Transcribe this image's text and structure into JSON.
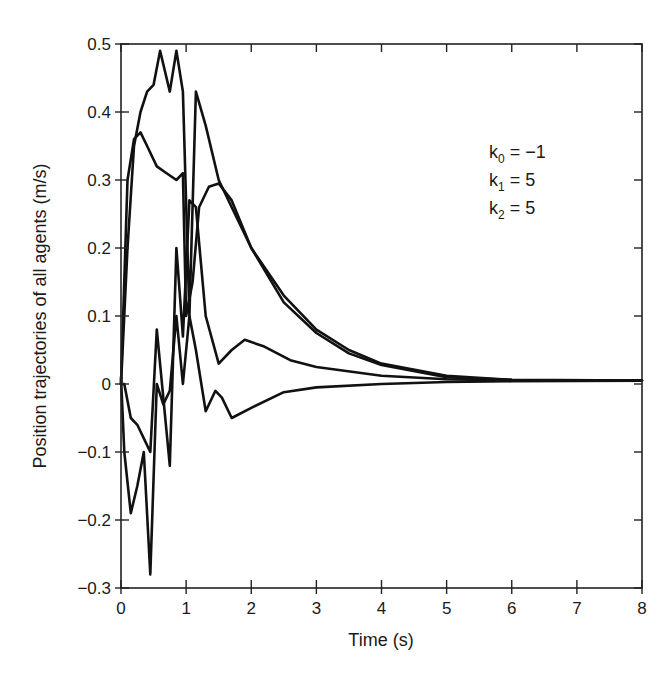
{
  "chart_data": {
    "type": "line",
    "title": "",
    "xlabel": "Time (s)",
    "ylabel": "Position trajectories of all agents (m/s)",
    "xlim": [
      0,
      8
    ],
    "ylim": [
      -0.3,
      0.5
    ],
    "xticks": [
      0,
      1,
      2,
      3,
      4,
      5,
      6,
      7,
      8
    ],
    "xtick_labels": [
      "0",
      "1",
      "2",
      "3",
      "4",
      "5",
      "6",
      "7",
      "8"
    ],
    "yticks": [
      -0.3,
      -0.2,
      -0.1,
      0,
      0.1,
      0.2,
      0.3,
      0.4,
      0.5
    ],
    "ytick_labels": [
      "−0.3",
      "−0.2",
      "−0.1",
      "0",
      "0.1",
      "0.2",
      "0.3",
      "0.4",
      "0.5"
    ],
    "grid": false,
    "legend": null,
    "annotations": [
      {
        "base": "k",
        "sub": "0",
        "rest": " = −1"
      },
      {
        "base": "k",
        "sub": "1",
        "rest": " = 5"
      },
      {
        "base": "k",
        "sub": "2",
        "rest": " = 5"
      }
    ],
    "series": [
      {
        "name": "agent 1",
        "x": [
          0,
          0.1,
          0.2,
          0.3,
          0.4,
          0.5,
          0.6,
          0.75,
          0.85,
          0.95,
          1.05,
          1.15,
          1.3,
          1.5,
          1.7,
          2.0,
          2.5,
          3.0,
          3.5,
          4.0,
          5.0,
          6.0,
          8.0
        ],
        "y": [
          0.0,
          0.2,
          0.35,
          0.4,
          0.43,
          0.44,
          0.49,
          0.43,
          0.49,
          0.43,
          0.1,
          0.43,
          0.38,
          0.3,
          0.26,
          0.2,
          0.13,
          0.08,
          0.05,
          0.03,
          0.012,
          0.006,
          0.005
        ]
      },
      {
        "name": "agent 2",
        "x": [
          0,
          0.1,
          0.2,
          0.3,
          0.4,
          0.55,
          0.7,
          0.85,
          0.95,
          1.0,
          1.1,
          1.2,
          1.35,
          1.5,
          1.7,
          2.0,
          2.5,
          3.0,
          3.5,
          4.0,
          5.0,
          6.0,
          8.0
        ],
        "y": [
          0.0,
          0.3,
          0.36,
          0.37,
          0.35,
          0.32,
          0.31,
          0.3,
          0.31,
          0.1,
          0.15,
          0.26,
          0.29,
          0.295,
          0.27,
          0.2,
          0.12,
          0.075,
          0.045,
          0.028,
          0.01,
          0.006,
          0.005
        ]
      },
      {
        "name": "agent 3",
        "x": [
          0,
          0.05,
          0.15,
          0.25,
          0.35,
          0.45,
          0.55,
          0.65,
          0.75,
          0.85,
          0.95,
          1.05,
          1.15,
          1.3,
          1.5,
          1.7,
          1.9,
          2.2,
          2.6,
          3.0,
          4.0,
          5.0,
          6.0,
          8.0
        ],
        "y": [
          0.0,
          0.0,
          -0.05,
          -0.06,
          -0.08,
          -0.1,
          0.08,
          -0.02,
          -0.12,
          0.2,
          0.07,
          0.27,
          0.26,
          0.1,
          0.03,
          0.05,
          0.065,
          0.055,
          0.035,
          0.025,
          0.012,
          0.007,
          0.005,
          0.005
        ]
      },
      {
        "name": "agent 4",
        "x": [
          0,
          0.05,
          0.15,
          0.25,
          0.35,
          0.45,
          0.55,
          0.65,
          0.75,
          0.85,
          0.95,
          1.05,
          1.15,
          1.3,
          1.45,
          1.55,
          1.7,
          2.0,
          2.5,
          3.0,
          4.0,
          5.0,
          6.0,
          8.0
        ],
        "y": [
          0.01,
          -0.1,
          -0.19,
          -0.15,
          -0.1,
          -0.28,
          0.0,
          -0.03,
          -0.01,
          0.1,
          0.0,
          0.1,
          0.05,
          -0.04,
          -0.01,
          -0.02,
          -0.05,
          -0.035,
          -0.012,
          -0.005,
          0.0,
          0.003,
          0.004,
          0.005
        ]
      }
    ]
  }
}
